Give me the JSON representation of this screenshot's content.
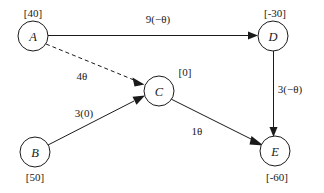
{
  "diagram": {
    "type": "network-flow-graph",
    "title": "",
    "background_color": "#ffffff",
    "line_color": "#1a1a1a",
    "nodes": [
      {
        "id": "A",
        "label": "A",
        "supply": "[40]",
        "supply_position": "above",
        "cx": 33,
        "cy": 36,
        "r": 15
      },
      {
        "id": "B",
        "label": "B",
        "supply": "[50]",
        "supply_position": "below",
        "cx": 35,
        "cy": 152,
        "r": 15
      },
      {
        "id": "C",
        "label": "C",
        "supply": "[0]",
        "supply_position": "right-above",
        "cx": 159,
        "cy": 91,
        "r": 15
      },
      {
        "id": "D",
        "label": "D",
        "supply": "[-30]",
        "supply_position": "above",
        "cx": 273,
        "cy": 36,
        "r": 15
      },
      {
        "id": "E",
        "label": "E",
        "supply": "[-60]",
        "supply_position": "below",
        "cx": 275,
        "cy": 151,
        "r": 15
      }
    ],
    "edges": [
      {
        "id": "A-D",
        "from": "A",
        "to": "D",
        "label": "9(−θ)",
        "style": "solid",
        "label_x": 158,
        "label_y": 19
      },
      {
        "id": "A-C",
        "from": "A",
        "to": "C",
        "label": "4θ",
        "style": "dashed",
        "label_x": 82,
        "label_y": 76
      },
      {
        "id": "B-C",
        "from": "B",
        "to": "C",
        "label": "3(0)",
        "style": "solid",
        "label_x": 84,
        "label_y": 113
      },
      {
        "id": "C-E",
        "from": "C",
        "to": "E",
        "label": "1θ",
        "style": "solid",
        "label_x": 197,
        "label_y": 131
      },
      {
        "id": "D-E",
        "from": "D",
        "to": "E",
        "label": "3(−θ)",
        "style": "solid",
        "label_x": 290,
        "label_y": 89
      }
    ]
  }
}
